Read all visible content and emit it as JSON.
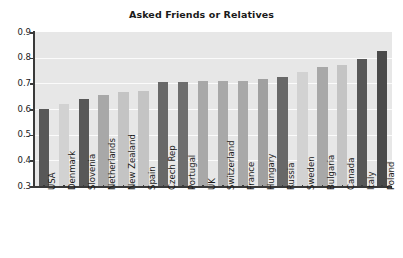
{
  "chart_data": {
    "type": "bar",
    "title": "Asked Friends or Relatives",
    "xlabel": "",
    "ylabel": "",
    "ylim": [
      0.3,
      0.9
    ],
    "yticks": [
      "0.3",
      "0.4",
      "0.5",
      "0.6",
      "0.7",
      "0.8",
      "0.9"
    ],
    "grid": true,
    "legend": "none",
    "categories": [
      "USA",
      "Denmark",
      "Slovenia",
      "Netherlands",
      "New Zealand",
      "Spain",
      "Czech Rep",
      "Portugal",
      "UK",
      "Switzerland",
      "France",
      "Hungary",
      "Russia",
      "Sweden",
      "Bulgaria",
      "Canada",
      "Italy",
      "Poland"
    ],
    "values": [
      0.6,
      0.62,
      0.64,
      0.655,
      0.665,
      0.67,
      0.705,
      0.705,
      0.71,
      0.71,
      0.71,
      0.715,
      0.725,
      0.745,
      0.765,
      0.77,
      0.795,
      0.825
    ],
    "bar_colors": [
      "#585858",
      "#d2d2d2",
      "#585858",
      "#a8a8a8",
      "#c4c4c4",
      "#c4c4c4",
      "#686868",
      "#6e6e6e",
      "#a8a8a8",
      "#a8a8a8",
      "#a8a8a8",
      "#a0a0a0",
      "#686868",
      "#d2d2d2",
      "#a8a8a8",
      "#c4c4c4",
      "#585858",
      "#4a4a4a"
    ]
  },
  "style": {
    "plot_background": "#e7e7e7",
    "gridline_color": "#fbfbfb",
    "axis_color": "#3a3a3a",
    "text_color": "#1a1a1a",
    "figure_background": "#ffffff"
  }
}
